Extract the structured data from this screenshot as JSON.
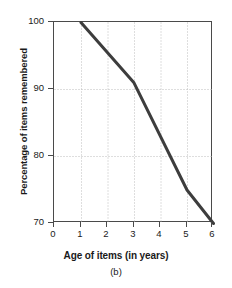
{
  "chart_data": {
    "type": "line",
    "title": "",
    "subtitle": "",
    "caption": "(b)",
    "xlabel": "Age of items (in years)",
    "ylabel": "Percentage of items remembered",
    "xlim": [
      0,
      6
    ],
    "ylim": [
      70,
      100
    ],
    "xticks": [
      "0",
      "1",
      "2",
      "3",
      "4",
      "5",
      "6"
    ],
    "xtick_values": [
      0,
      1,
      2,
      3,
      4,
      5,
      6
    ],
    "yticks": [
      "100",
      "90",
      "80",
      "70"
    ],
    "ytick_values": [
      100,
      90,
      80,
      70
    ],
    "grid": true,
    "grid_style": "dotted",
    "legend": "none",
    "series": [
      {
        "name": "Percentage of items remembered",
        "x": [
          1,
          3,
          5,
          6
        ],
        "values": [
          100,
          91,
          75,
          70
        ]
      }
    ],
    "line_color": "#3d3d3d",
    "axis_color": "#4a4a4a",
    "grid_color": "#bdbdbd",
    "background_color": "#ffffff"
  }
}
